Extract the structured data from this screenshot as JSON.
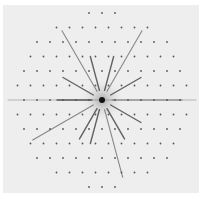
{
  "image": {
    "subject": "diffraction pattern",
    "background_color": "#eeeeee",
    "spot_color": "#555555",
    "center": [
      102,
      100
    ]
  }
}
